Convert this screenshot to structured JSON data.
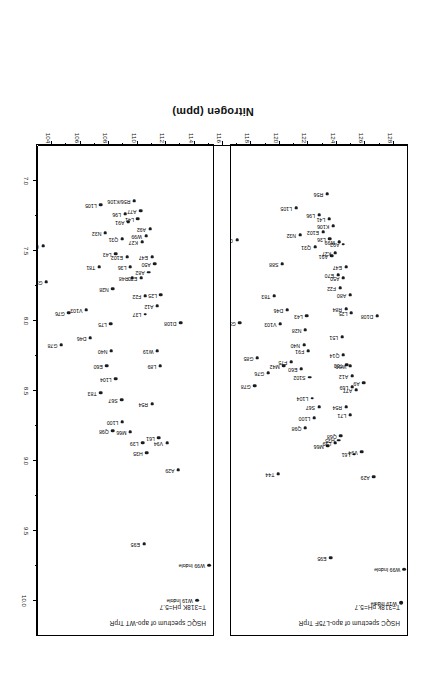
{
  "figure": {
    "axis_title_nitrogen": "Nitrogen (ppm)",
    "rotation_degrees": 180
  },
  "panels": [
    {
      "id": "panel-l75f",
      "title_line1": "HSQC spectrum of apo-L75F TrpR",
      "title_line2": "T=318k pH=5.7"
    },
    {
      "id": "panel-wt",
      "title_line1": "HSQC spectrum of apo-WT TrpR",
      "title_line2": "T=318K pH=5.7"
    }
  ],
  "axes": {
    "proton": {
      "label": "",
      "ticks": [
        "7.0",
        "7.5",
        "8.0",
        "8.5",
        "9.0",
        "9.5",
        "10.0"
      ],
      "min": 6.75,
      "max": 10.25
    },
    "nitrogen": {
      "label": "Nitrogen (ppm)",
      "ticks": [
        "104",
        "106",
        "108",
        "110",
        "112",
        "114",
        "116",
        "118",
        "120",
        "122",
        "124",
        "126",
        "128"
      ],
      "min": 103.0,
      "max": 129.0
    }
  },
  "chart_data": {
    "type": "scatter",
    "xlabel": "Proton (ppm)",
    "ylabel": "Nitrogen (ppm)",
    "xlim": [
      10.25,
      6.75
    ],
    "ylim": [
      129.0,
      103.0
    ],
    "grid": false,
    "legend": "none",
    "series": [
      {
        "name": "apo-L75F TrpR",
        "panel": "panel-l75f",
        "points": [
          {
            "label": "G64",
            "h": 7.43,
            "n": 103.9
          },
          {
            "label": "G52",
            "h": 8.02,
            "n": 104.3
          },
          {
            "label": "G78",
            "h": 8.47,
            "n": 106.5
          },
          {
            "label": "G85",
            "h": 8.27,
            "n": 106.9
          },
          {
            "label": "G76",
            "h": 8.38,
            "n": 108.5
          },
          {
            "label": "T83",
            "h": 7.83,
            "n": 109.4
          },
          {
            "label": "V103",
            "h": 8.03,
            "n": 110.3
          },
          {
            "label": "M42",
            "h": 8.33,
            "n": 110.8
          },
          {
            "label": "S88",
            "h": 7.6,
            "n": 110.6
          },
          {
            "label": "D46",
            "h": 7.93,
            "n": 111.3
          },
          {
            "label": "F75",
            "h": 8.3,
            "n": 111.9
          },
          {
            "label": "T44",
            "h": 9.1,
            "n": 110.0
          },
          {
            "label": "L105",
            "h": 7.2,
            "n": 112.6
          },
          {
            "label": "N32",
            "h": 7.39,
            "n": 113.2
          },
          {
            "label": "E60",
            "h": 8.35,
            "n": 113.4
          },
          {
            "label": "N40",
            "h": 8.18,
            "n": 113.8
          },
          {
            "label": "N28",
            "h": 8.07,
            "n": 114.0
          },
          {
            "label": "L43",
            "h": 7.97,
            "n": 114.2
          },
          {
            "label": "F91",
            "h": 8.22,
            "n": 114.4
          },
          {
            "label": "S102",
            "h": 8.41,
            "n": 114.6
          },
          {
            "label": "L104",
            "h": 8.56,
            "n": 115.0
          },
          {
            "label": "Q98",
            "h": 8.77,
            "n": 114.0
          },
          {
            "label": "L100",
            "h": 8.7,
            "n": 115.3
          },
          {
            "label": "S67",
            "h": 8.62,
            "n": 116.0
          },
          {
            "label": "Q31",
            "h": 7.48,
            "n": 115.4
          },
          {
            "label": "L96",
            "h": 7.25,
            "n": 116.0
          },
          {
            "label": "E102",
            "h": 7.37,
            "n": 116.6
          },
          {
            "label": "R56",
            "h": 7.1,
            "n": 117.2
          },
          {
            "label": "L41",
            "h": 7.28,
            "n": 117.5
          },
          {
            "label": "L36",
            "h": 7.42,
            "n": 117.6
          },
          {
            "label": "K106",
            "h": 7.33,
            "n": 118.1
          },
          {
            "label": "A91",
            "h": 7.54,
            "n": 117.9
          },
          {
            "label": "K27",
            "h": 7.52,
            "n": 118.4
          },
          {
            "label": "W99",
            "h": 7.44,
            "n": 119.0
          },
          {
            "label": "A92",
            "h": 7.46,
            "n": 119.6
          },
          {
            "label": "E70",
            "h": 7.68,
            "n": 118.8
          },
          {
            "label": "F22",
            "h": 7.77,
            "n": 119.1
          },
          {
            "label": "A50",
            "h": 7.7,
            "n": 119.6
          },
          {
            "label": "E47",
            "h": 7.62,
            "n": 120.0
          },
          {
            "label": "L51",
            "h": 8.12,
            "n": 119.4
          },
          {
            "label": "Q14",
            "h": 8.25,
            "n": 119.6
          },
          {
            "label": "T53",
            "h": 8.32,
            "n": 120.1
          },
          {
            "label": "R84",
            "h": 7.92,
            "n": 120.0
          },
          {
            "label": "A80",
            "h": 7.82,
            "n": 120.6
          },
          {
            "label": "L25",
            "h": 7.95,
            "n": 120.8
          },
          {
            "label": "A12",
            "h": 8.4,
            "n": 120.9
          },
          {
            "label": "W19",
            "h": 8.33,
            "n": 120.6
          },
          {
            "label": "L69",
            "h": 8.48,
            "n": 120.9
          },
          {
            "label": "A77",
            "h": 8.5,
            "n": 121.5
          },
          {
            "label": "L71",
            "h": 8.68,
            "n": 120.6
          },
          {
            "label": "M66",
            "h": 8.9,
            "n": 117.3
          },
          {
            "label": "L39",
            "h": 8.88,
            "n": 118.4
          },
          {
            "label": "H35",
            "h": 8.86,
            "n": 118.9
          },
          {
            "label": "Q68",
            "h": 8.83,
            "n": 119.2
          },
          {
            "label": "R54",
            "h": 8.62,
            "n": 120.0
          },
          {
            "label": "L61",
            "h": 8.96,
            "n": 121.2
          },
          {
            "label": "V94",
            "h": 8.94,
            "n": 122.3
          },
          {
            "label": "A9",
            "h": 8.45,
            "n": 122.6
          },
          {
            "label": "A29",
            "h": 9.12,
            "n": 124.1
          },
          {
            "label": "D108",
            "h": 7.97,
            "n": 124.6
          },
          {
            "label": "E95",
            "h": 9.7,
            "n": 117.7
          },
          {
            "label": "W19 Indole",
            "h": 10.02,
            "n": 128.1
          },
          {
            "label": "W99 Indole",
            "h": 9.78,
            "n": 128.6
          }
        ]
      },
      {
        "name": "apo-WT TrpR",
        "panel": "panel-wt",
        "points": [
          {
            "label": "G64",
            "h": 7.47,
            "n": 103.9
          },
          {
            "label": "G52",
            "h": 7.73,
            "n": 104.4
          },
          {
            "label": "G78",
            "h": 8.18,
            "n": 106.6
          },
          {
            "label": "G76",
            "h": 7.95,
            "n": 107.7
          },
          {
            "label": "V103",
            "h": 7.93,
            "n": 110.3
          },
          {
            "label": "D46",
            "h": 8.13,
            "n": 110.9
          },
          {
            "label": "T81",
            "h": 7.62,
            "n": 112.2
          },
          {
            "label": "L105",
            "h": 7.18,
            "n": 112.4
          },
          {
            "label": "N32",
            "h": 7.38,
            "n": 113.1
          },
          {
            "label": "T83",
            "h": 8.52,
            "n": 112.4
          },
          {
            "label": "E60",
            "h": 8.33,
            "n": 113.3
          },
          {
            "label": "L75",
            "h": 8.03,
            "n": 113.9
          },
          {
            "label": "N40",
            "h": 8.22,
            "n": 114.0
          },
          {
            "label": "N28",
            "h": 7.78,
            "n": 114.2
          },
          {
            "label": "L43",
            "h": 7.53,
            "n": 114.6
          },
          {
            "label": "L104",
            "h": 8.42,
            "n": 114.6
          },
          {
            "label": "Q98",
            "h": 8.79,
            "n": 114.2
          },
          {
            "label": "S67",
            "h": 8.57,
            "n": 115.5
          },
          {
            "label": "L100",
            "h": 8.73,
            "n": 115.6
          },
          {
            "label": "M66",
            "h": 8.8,
            "n": 116.8
          },
          {
            "label": "Q31",
            "h": 7.42,
            "n": 115.6
          },
          {
            "label": "L96",
            "h": 7.24,
            "n": 116.0
          },
          {
            "label": "A91",
            "h": 7.3,
            "n": 116.5
          },
          {
            "label": "E102",
            "h": 7.55,
            "n": 116.3
          },
          {
            "label": "L36",
            "h": 7.62,
            "n": 116.8
          },
          {
            "label": "R48",
            "h": 7.7,
            "n": 117.1
          },
          {
            "label": "R56/K106",
            "h": 7.15,
            "n": 117.4
          },
          {
            "label": "L41",
            "h": 7.28,
            "n": 117.9
          },
          {
            "label": "A77",
            "h": 7.22,
            "n": 118.3
          },
          {
            "label": "K27",
            "h": 7.44,
            "n": 118.5
          },
          {
            "label": "W99",
            "h": 7.4,
            "n": 119.1
          },
          {
            "label": "A92",
            "h": 7.35,
            "n": 119.7
          },
          {
            "label": "E70",
            "h": 7.7,
            "n": 118.4
          },
          {
            "label": "F22",
            "h": 7.83,
            "n": 119.0
          },
          {
            "label": "A82",
            "h": 7.66,
            "n": 119.5
          },
          {
            "label": "E47",
            "h": 7.55,
            "n": 120.0
          },
          {
            "label": "A50",
            "h": 7.6,
            "n": 120.4
          },
          {
            "label": "L37",
            "h": 7.96,
            "n": 119.0
          },
          {
            "label": "A12",
            "h": 7.9,
            "n": 120.8
          },
          {
            "label": "L25",
            "h": 7.82,
            "n": 121.3
          },
          {
            "label": "W19",
            "h": 8.22,
            "n": 120.8
          },
          {
            "label": "L89",
            "h": 8.33,
            "n": 121.2
          },
          {
            "label": "L39",
            "h": 8.88,
            "n": 118.6
          },
          {
            "label": "H35",
            "h": 8.95,
            "n": 119.2
          },
          {
            "label": "R54",
            "h": 8.6,
            "n": 120.0
          },
          {
            "label": "L61",
            "h": 8.84,
            "n": 121.0
          },
          {
            "label": "V94",
            "h": 8.88,
            "n": 122.2
          },
          {
            "label": "A29",
            "h": 9.07,
            "n": 123.9
          },
          {
            "label": "D108",
            "h": 8.02,
            "n": 124.2
          },
          {
            "label": "E95",
            "h": 9.6,
            "n": 118.8
          },
          {
            "label": "W19 Indole",
            "h": 10.0,
            "n": 126.6
          },
          {
            "label": "W99 Indole",
            "h": 9.75,
            "n": 128.4
          }
        ]
      }
    ]
  }
}
